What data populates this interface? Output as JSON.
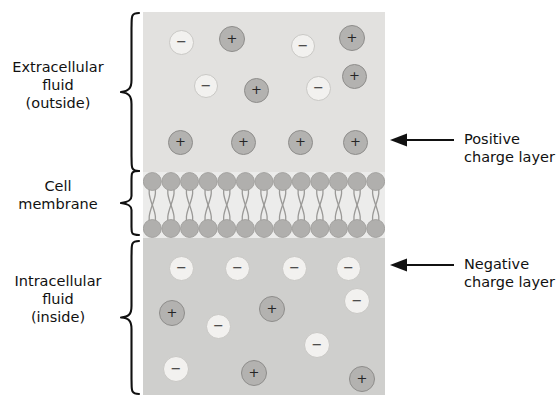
{
  "diagram": {
    "colors": {
      "extracellular_fluid": "#e2e1df",
      "intracellular_fluid": "#cfcfcd",
      "membrane_background": "#ececeb",
      "lipid_head": "#b0afad",
      "lipid_tail": "#9a9997",
      "positive_ion_fill": "#b3b2b0",
      "negative_ion_fill": "#f2f1ef",
      "text": "#111111",
      "arrow": "#111111"
    },
    "regions": [
      {
        "id": "extracellular",
        "label_lines": [
          "Extracellular",
          "fluid",
          "(outside)"
        ],
        "brace": "left-curly-brace"
      },
      {
        "id": "membrane",
        "label_lines": [
          "Cell",
          "membrane"
        ],
        "brace": "left-curly-brace"
      },
      {
        "id": "intracellular",
        "label_lines": [
          "Intracellular",
          "fluid",
          "(inside)"
        ],
        "brace": "left-curly-brace"
      }
    ],
    "callouts": [
      {
        "id": "positive-charge-layer",
        "lines": [
          "Positive",
          "charge layer"
        ],
        "arrow": "left-arrow"
      },
      {
        "id": "negative-charge-layer",
        "lines": [
          "Negative",
          "charge layer"
        ],
        "arrow": "left-arrow"
      }
    ],
    "ions": {
      "positive_symbol": "+",
      "negative_symbol": "−",
      "extracellular_scattered": [
        {
          "charge": "negative",
          "x": 26,
          "y": 18,
          "d": 25
        },
        {
          "charge": "positive",
          "x": 76,
          "y": 14,
          "d": 26
        },
        {
          "charge": "negative",
          "x": 148,
          "y": 22,
          "d": 24
        },
        {
          "charge": "positive",
          "x": 196,
          "y": 13,
          "d": 26
        },
        {
          "charge": "negative",
          "x": 51,
          "y": 62,
          "d": 24
        },
        {
          "charge": "positive",
          "x": 101,
          "y": 66,
          "d": 25
        },
        {
          "charge": "negative",
          "x": 163,
          "y": 64,
          "d": 25
        },
        {
          "charge": "positive",
          "x": 199,
          "y": 52,
          "d": 25
        }
      ],
      "positive_charge_layer": [
        {
          "charge": "positive",
          "x": 25,
          "y": 118,
          "d": 25
        },
        {
          "charge": "positive",
          "x": 88,
          "y": 118,
          "d": 25
        },
        {
          "charge": "positive",
          "x": 145,
          "y": 118,
          "d": 25
        },
        {
          "charge": "positive",
          "x": 200,
          "y": 118,
          "d": 25
        }
      ],
      "negative_charge_layer": [
        {
          "charge": "negative",
          "x": 26,
          "y": 18,
          "d": 25
        },
        {
          "charge": "negative",
          "x": 82,
          "y": 18,
          "d": 25
        },
        {
          "charge": "negative",
          "x": 139,
          "y": 18,
          "d": 25
        },
        {
          "charge": "negative",
          "x": 193,
          "y": 18,
          "d": 25
        }
      ],
      "intracellular_scattered": [
        {
          "charge": "positive",
          "x": 16,
          "y": 62,
          "d": 26
        },
        {
          "charge": "negative",
          "x": 63,
          "y": 76,
          "d": 25
        },
        {
          "charge": "positive",
          "x": 116,
          "y": 58,
          "d": 26
        },
        {
          "charge": "negative",
          "x": 201,
          "y": 50,
          "d": 26
        },
        {
          "charge": "negative",
          "x": 161,
          "y": 94,
          "d": 26
        },
        {
          "charge": "negative",
          "x": 20,
          "y": 118,
          "d": 26
        },
        {
          "charge": "positive",
          "x": 98,
          "y": 122,
          "d": 26
        },
        {
          "charge": "positive",
          "x": 206,
          "y": 128,
          "d": 26
        }
      ]
    },
    "bilayer": {
      "head_count": 13,
      "head_radius": 9,
      "description": "phospholipid bilayer with two rows of head groups and crossing hydrophobic tails"
    }
  }
}
